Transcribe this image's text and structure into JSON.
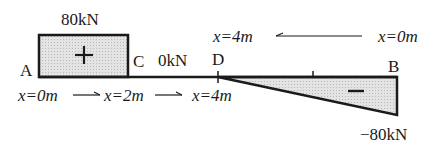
{
  "diagram": {
    "positive_region": {
      "value_label": "80kN",
      "sign": "+",
      "from_point": "A",
      "to_point": "C"
    },
    "zero_region": {
      "value_label": "0kN",
      "from_point": "C",
      "to_point": "D"
    },
    "negative_region": {
      "value_label": "−80kN",
      "sign": "−",
      "from_point": "D",
      "to_point": "B"
    },
    "points": {
      "A": "A",
      "C": "C",
      "D": "D",
      "B": "B"
    },
    "left_axis": {
      "x0": "x=0m",
      "x2": "x=2m",
      "x4": "x=4m",
      "arrow": "→"
    },
    "right_axis": {
      "x4": "x=4m",
      "x0": "x=0m",
      "arrow": "←"
    },
    "colors": {
      "fill": "#d9d9d9",
      "stroke": "#1a1a1a",
      "background": "#ffffff"
    }
  }
}
